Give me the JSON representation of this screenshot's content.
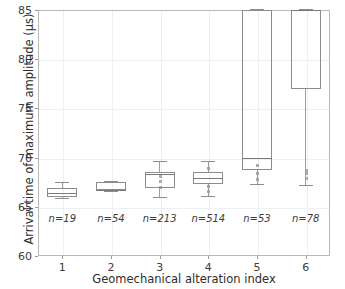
{
  "chart_data": {
    "type": "box",
    "title": "",
    "xlabel": "Geomechanical alteration index",
    "ylabel": "Arrival time of maximum amplitude (μs)",
    "xlim": [
      0.5,
      6.5
    ],
    "ylim": [
      60,
      85
    ],
    "ytick_labels": [
      "60",
      "65",
      "70",
      "75",
      "80",
      "85"
    ],
    "ytick_values": [
      60,
      65,
      70,
      75,
      80,
      85
    ],
    "xtick_labels": [
      "1",
      "2",
      "3",
      "4",
      "5",
      "6"
    ],
    "xtick_values": [
      1,
      2,
      3,
      4,
      5,
      6
    ],
    "grid": true,
    "legend": "none",
    "categories": [
      "1",
      "2",
      "3",
      "4",
      "5",
      "6"
    ],
    "annotations": [
      "n=19",
      "n=54",
      "n=213",
      "n=514",
      "n=53",
      "n=78"
    ],
    "annotation_y": 64.4,
    "boxes": [
      {
        "category": "1",
        "n": 19,
        "n_label": "n=19",
        "whisker_low": 65.9,
        "q1": 66.0,
        "median": 66.4,
        "q3": 66.9,
        "whisker_high": 67.5,
        "fliers": []
      },
      {
        "category": "2",
        "n": 54,
        "n_label": "n=54",
        "whisker_low": 66.6,
        "q1": 66.7,
        "median": 66.75,
        "q3": 67.5,
        "whisker_high": 67.6,
        "fliers": []
      },
      {
        "category": "3",
        "n": 213,
        "n_label": "n=213",
        "whisker_low": 66.0,
        "q1": 66.9,
        "median": 68.3,
        "q3": 68.5,
        "whisker_high": 69.7,
        "fliers": [
          67.0,
          67.6,
          68.1
        ]
      },
      {
        "category": "4",
        "n": 514,
        "n_label": "n=514",
        "whisker_low": 66.1,
        "q1": 67.3,
        "median": 67.9,
        "q3": 68.5,
        "whisker_high": 69.7,
        "fliers": [
          66.6,
          67.1,
          68.9
        ]
      },
      {
        "category": "5",
        "n": 53,
        "n_label": "n=53",
        "whisker_low": 67.3,
        "q1": 68.75,
        "median": 70.0,
        "q3": 85.0,
        "whisker_high": 85.1,
        "fliers": [
          67.8,
          68.4,
          69.2
        ]
      },
      {
        "category": "6",
        "n": 78,
        "n_label": "n=78",
        "whisker_low": 67.2,
        "q1": 77.0,
        "median": 85.0,
        "q3": 85.0,
        "whisker_high": 85.1,
        "fliers": [
          67.9,
          68.4,
          68.7
        ]
      }
    ]
  },
  "colors": {
    "box_edge": "#8c8c8c",
    "median": "#7a7a7a",
    "whisker": "#9d9d9d",
    "grid": "#eceff4",
    "frame": "#b8b8b8",
    "text": "#3c3c3c",
    "background": "#ffffff"
  }
}
